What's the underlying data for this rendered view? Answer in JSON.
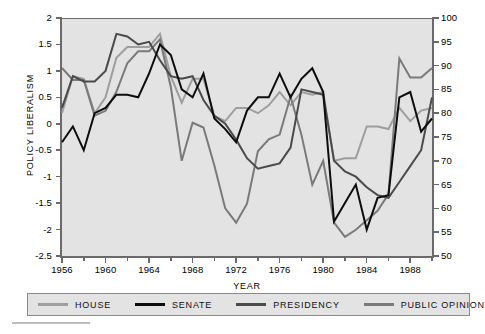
{
  "chart_data": {
    "type": "line",
    "title": "",
    "xlabel": "YEAR",
    "ylabel": "POLICY LIBERALISM",
    "ylabel_right": "PUBLIC OPINION LIBERALISM",
    "xlim": [
      1956,
      1990
    ],
    "ylim": [
      -2.5,
      2
    ],
    "ylim_right": [
      50,
      100
    ],
    "grid": false,
    "legend_position": "bottom",
    "x_ticks_major": [
      1956,
      1960,
      1964,
      1968,
      1972,
      1976,
      1980,
      1984,
      1988
    ],
    "x_ticks_minor": [
      1958,
      1962,
      1966,
      1970,
      1974,
      1978,
      1982,
      1986,
      1990
    ],
    "y_ticks_left": [
      "2",
      "1.5",
      "1",
      "0.5",
      "0",
      "-0.5",
      "-1",
      "-1.5",
      "-2",
      "-2.5"
    ],
    "y_ticks_right": [
      "100",
      "95",
      "90",
      "85",
      "80",
      "75",
      "70",
      "65",
      "60",
      "55",
      "50"
    ],
    "x": [
      1956,
      1957,
      1958,
      1959,
      1960,
      1961,
      1962,
      1963,
      1964,
      1965,
      1966,
      1967,
      1968,
      1969,
      1970,
      1971,
      1972,
      1973,
      1974,
      1975,
      1976,
      1977,
      1978,
      1979,
      1980,
      1981,
      1982,
      1983,
      1984,
      1985,
      1986,
      1987,
      1988,
      1989,
      1990
    ],
    "series": [
      {
        "name": "HOUSE",
        "color": "#9e9e9e",
        "axis": "left",
        "values": [
          0.2,
          0.9,
          0.85,
          0.2,
          0.5,
          1.25,
          1.45,
          1.45,
          1.45,
          1.7,
          0.9,
          0.4,
          0.85,
          0.85,
          0.15,
          0.05,
          0.3,
          0.3,
          0.2,
          0.35,
          0.6,
          0.35,
          0.6,
          0.55,
          0.6,
          -0.7,
          -0.65,
          -0.65,
          -0.05,
          -0.05,
          -0.1,
          0.3,
          0.05,
          0.25,
          0.3
        ]
      },
      {
        "name": "SENATE",
        "color": "#0d0d0d",
        "axis": "left",
        "values": [
          -0.35,
          -0.05,
          -0.5,
          0.2,
          0.3,
          0.55,
          0.55,
          0.5,
          0.95,
          1.5,
          1.3,
          0.65,
          0.5,
          0.95,
          0.1,
          -0.1,
          -0.35,
          0.25,
          0.5,
          0.5,
          0.95,
          0.5,
          0.85,
          1.05,
          0.6,
          -1.85,
          -1.5,
          -1.15,
          -2.0,
          -1.4,
          -1.35,
          0.5,
          0.6,
          -0.15,
          0.1
        ]
      },
      {
        "name": "PRESIDENCY",
        "color": "#4a4a4a",
        "axis": "left",
        "values": [
          0.3,
          0.9,
          0.8,
          0.8,
          1.0,
          1.7,
          1.65,
          1.5,
          1.55,
          1.2,
          0.9,
          0.85,
          0.9,
          0.45,
          0.15,
          0.0,
          -0.3,
          -0.65,
          -0.85,
          -0.8,
          -0.75,
          -0.45,
          0.65,
          0.6,
          0.55,
          -0.7,
          -0.9,
          -1.0,
          -1.2,
          -1.35,
          -1.4,
          -1.1,
          -0.8,
          -0.5,
          0.5
        ]
      },
      {
        "name": "PUBLIC OPINION",
        "color": "#7a7a7a",
        "axis": "right",
        "values": [
          89.5,
          87.0,
          87.0,
          79.5,
          80.5,
          84.5,
          90.5,
          93.0,
          93.0,
          95.5,
          85.5,
          70.0,
          78.0,
          77.0,
          69.0,
          60.0,
          57.0,
          61.0,
          72.0,
          74.5,
          75.5,
          83.5,
          75.5,
          65.0,
          70.0,
          57.0,
          54.0,
          55.5,
          57.5,
          59.5,
          63.0,
          91.5,
          87.5,
          87.5,
          89.5
        ]
      }
    ]
  },
  "legend": {
    "items": [
      {
        "label": "HOUSE",
        "color": "#9e9e9e"
      },
      {
        "label": "SENATE",
        "color": "#0d0d0d"
      },
      {
        "label": "PRESIDENCY",
        "color": "#4a4a4a"
      },
      {
        "label": "PUBLIC OPINION",
        "color": "#7a7a7a"
      }
    ]
  },
  "colors": {
    "plot_background": "#e3e3e3",
    "axis": "#6a6a6a",
    "page_background": "#ffffff",
    "text": "#000000"
  }
}
